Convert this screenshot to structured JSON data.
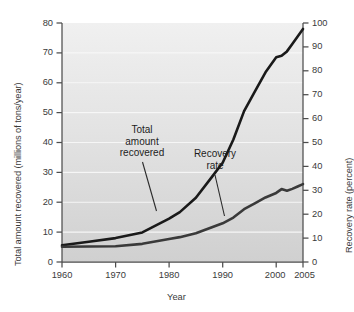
{
  "chart_data": {
    "type": "line",
    "title": "",
    "xlabel": "Year",
    "ylabel": "Total amount recovered (millions of tons/year)",
    "y2label": "Recovery rate (percent)",
    "xlim": [
      1960,
      2005
    ],
    "ylim": [
      0,
      80
    ],
    "y2lim": [
      0,
      100
    ],
    "grid": true,
    "legend_position": "inline-annotations",
    "xticks": [
      1960,
      1970,
      1980,
      1990,
      2000,
      2005
    ],
    "xticklabels": [
      "1960",
      "1970",
      "1980",
      "1990",
      "2000",
      "2005"
    ],
    "yticks": [
      0,
      10,
      20,
      30,
      40,
      50,
      60,
      70,
      80
    ],
    "yticklabels": [
      "0",
      "10",
      "20",
      "30",
      "40",
      "50",
      "60",
      "70",
      "80"
    ],
    "y2ticks": [
      0,
      10,
      20,
      30,
      40,
      50,
      60,
      70,
      80,
      90,
      100
    ],
    "y2ticklabels": [
      "0",
      "10",
      "20",
      "30",
      "40",
      "50",
      "60",
      "70",
      "80",
      "90",
      "100"
    ],
    "series": [
      {
        "name": "Total amount recovered",
        "axis": "left",
        "units": "millions of tons/year",
        "color": "#1a1a1a",
        "x": [
          1960,
          1965,
          1970,
          1975,
          1980,
          1982,
          1985,
          1988,
          1990,
          1992,
          1994,
          1996,
          1998,
          2000,
          2001,
          2002,
          2003,
          2004,
          2005
        ],
        "values": [
          5.6,
          6.8,
          8.0,
          9.9,
          14.5,
          16.7,
          21.5,
          28.5,
          33.2,
          41.0,
          50.5,
          57.0,
          63.5,
          68.5,
          69.0,
          70.5,
          73.0,
          75.5,
          78.0
        ]
      },
      {
        "name": "Recovery rate",
        "axis": "right",
        "units": "percent",
        "color": "#3a3a3a",
        "x": [
          1960,
          1965,
          1970,
          1975,
          1980,
          1982,
          1985,
          1988,
          1990,
          1992,
          1994,
          1996,
          1998,
          2000,
          2001,
          2002,
          2003,
          2004,
          2005
        ],
        "values": [
          6.4,
          6.5,
          6.6,
          7.6,
          9.6,
          10.4,
          12.0,
          14.5,
          16.2,
          18.6,
          22.1,
          24.5,
          27.0,
          28.9,
          30.5,
          29.8,
          30.6,
          31.6,
          32.6
        ]
      }
    ],
    "annotations": [
      {
        "id": "total",
        "text": "Total\namount\nrecovered",
        "series": "Total amount recovered"
      },
      {
        "id": "rate",
        "text": "Recovery\nrate",
        "series": "Recovery rate"
      }
    ]
  },
  "style": {
    "plot_bg_top": "#efefef",
    "plot_bg_bottom": "#d2d2d2",
    "gridline_color": "#f7f7f7",
    "axis_color": "#4d4d4d",
    "text_color": "#3a3a3a"
  }
}
